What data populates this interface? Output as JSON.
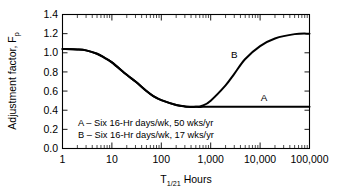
{
  "chart_data": {
    "type": "line",
    "title": "",
    "subtitle": "",
    "xlabel": "T1/21 Hours",
    "xlabel_base": "T",
    "xlabel_sub": "1/21",
    "xlabel_tail": " Hours",
    "ylabel": "Adjustment factor, Fp",
    "ylabel_base": "Adjustment factor, F",
    "ylabel_sub": "p",
    "xscale": "log",
    "yscale": "linear",
    "xlim": [
      1,
      100000
    ],
    "ylim": [
      0.0,
      1.4
    ],
    "grid": false,
    "legend_position": "inside-lower-left",
    "xticks": [
      1,
      10,
      100,
      1000,
      10000,
      100000
    ],
    "xtick_labels": [
      "1",
      "10",
      "100",
      "1,000",
      "10,000",
      "100,000"
    ],
    "yticks": [
      0.0,
      0.2,
      0.4,
      0.6,
      0.8,
      1.0,
      1.2,
      1.4
    ],
    "ytick_labels": [
      "0.0",
      "0.2",
      "0.4",
      "0.6",
      "0.8",
      "1.0",
      "1.2",
      "1.4"
    ],
    "minor_ticks": true,
    "line_color": "#000000",
    "frame_color": "#000000",
    "background_color": "#ffffff",
    "series": [
      {
        "name": "A",
        "label": "A – Six 16-Hr days/wk, 50 wks/yr",
        "annotation": "A",
        "x": [
          1,
          2,
          3,
          5,
          7,
          10,
          20,
          30,
          50,
          70,
          100,
          200,
          300,
          500,
          700,
          1000,
          2000,
          3000,
          5000,
          10000,
          20000,
          50000,
          100000
        ],
        "y": [
          1.04,
          1.035,
          1.025,
          0.99,
          0.95,
          0.9,
          0.77,
          0.7,
          0.6,
          0.545,
          0.505,
          0.455,
          0.44,
          0.435,
          0.435,
          0.435,
          0.435,
          0.435,
          0.435,
          0.435,
          0.435,
          0.435,
          0.435
        ]
      },
      {
        "name": "B",
        "label": "B – Six 16-Hr days/wk, 17 wks/yr",
        "annotation": "B",
        "x": [
          1,
          2,
          3,
          5,
          7,
          10,
          20,
          30,
          50,
          70,
          100,
          200,
          300,
          500,
          700,
          1000,
          2000,
          3000,
          5000,
          10000,
          20000,
          50000,
          100000
        ],
        "y": [
          1.04,
          1.035,
          1.025,
          0.99,
          0.95,
          0.9,
          0.77,
          0.7,
          0.6,
          0.545,
          0.505,
          0.455,
          0.44,
          0.435,
          0.45,
          0.5,
          0.66,
          0.78,
          0.935,
          1.07,
          1.15,
          1.195,
          1.2
        ]
      }
    ],
    "annotations": [
      {
        "text": "A",
        "x": 12000,
        "y": 0.5
      },
      {
        "text": "B",
        "x": 3000,
        "y": 0.95
      }
    ],
    "legend_entries": [
      "A – Six 16-Hr days/wk, 50 wks/yr",
      "B – Six 16-Hr days/wk, 17 wks/yr"
    ]
  }
}
